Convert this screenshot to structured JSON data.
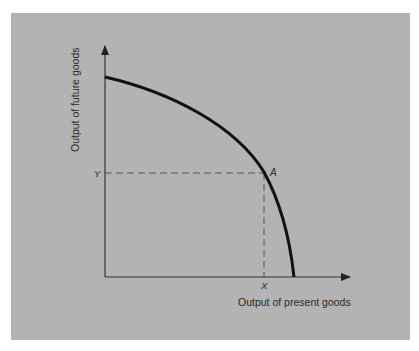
{
  "diagram": {
    "type": "production-possibilities-frontier",
    "y_axis_label": "Output of future goods",
    "x_axis_label": "Output of present goods",
    "point_label": "A",
    "x_point_label": "X",
    "y_point_label": "Y",
    "colors": {
      "background": "#b3b3b3",
      "curve": "#111111",
      "axes": "#333333",
      "dashed": "#555555",
      "text": "#2a2a2a"
    }
  }
}
